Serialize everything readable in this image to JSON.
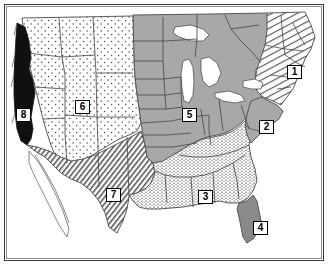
{
  "map": {
    "title": "United States regional map",
    "description": "Outline map of the contiguous United States divided into eight numbered regions distinguished by fill patterns",
    "frame": {
      "border_color": "#3b3b3b",
      "background_color": "#ffffff"
    },
    "palette": {
      "outline": "#4a4a4a",
      "plains_gray": "#a8a8a8",
      "florida_gray": "#8a8a8a",
      "midatlantic_gray": "#a8a8a8",
      "coastal_black": "#101010",
      "stipple_light": "#ffffff",
      "hatch_ink": "#5a5a5a",
      "lake_white": "#ffffff"
    },
    "regions": [
      {
        "number": "1",
        "name": "northeast",
        "fill": "diagonal-hatch",
        "label_x": 286,
        "label_y": 66
      },
      {
        "number": "2",
        "name": "mid-atlantic",
        "fill": "solid-gray",
        "label_x": 258,
        "label_y": 121
      },
      {
        "number": "3",
        "name": "southeast",
        "fill": "fine-stipple",
        "label_x": 197,
        "label_y": 191
      },
      {
        "number": "4",
        "name": "florida",
        "fill": "dark-gray",
        "label_x": 252,
        "label_y": 222
      },
      {
        "number": "5",
        "name": "midwest-plains",
        "fill": "solid-gray",
        "label_x": 181,
        "label_y": 109
      },
      {
        "number": "6",
        "name": "mountain-west",
        "fill": "dotted",
        "label_x": 74,
        "label_y": 101
      },
      {
        "number": "7",
        "name": "southwest-border",
        "fill": "dense-diagonal-hatch",
        "label_x": 105,
        "label_y": 189
      },
      {
        "number": "8",
        "name": "pacific-coast",
        "fill": "solid-black",
        "label_x": 15,
        "label_y": 109
      }
    ]
  }
}
